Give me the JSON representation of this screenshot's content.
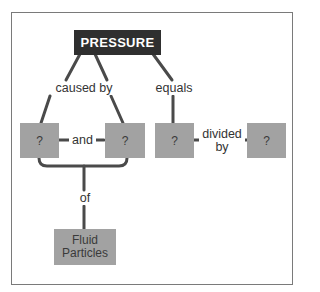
{
  "diagram": {
    "type": "concept-map",
    "colors": {
      "root_fill": "#2f2f2f",
      "root_text": "#ffffff",
      "node_fill": "#a2a2a2",
      "node_text": "#3a3a3a",
      "line": "#4a4a4a",
      "frame": "#7a7a7a"
    },
    "root": {
      "label": "PRESSURE"
    },
    "links": {
      "caused_by": "caused by",
      "equals": "equals",
      "and": "and",
      "divided_by_1": "divided",
      "divided_by_2": "by",
      "of": "of"
    },
    "nodes": {
      "cause_a": "?",
      "cause_b": "?",
      "numerator": "?",
      "denominator": "?",
      "fluid_particles_1": "Fluid",
      "fluid_particles_2": "Particles"
    }
  }
}
